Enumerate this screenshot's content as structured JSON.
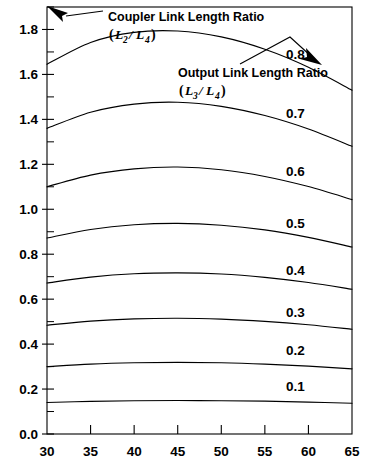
{
  "chart_data": {
    "type": "line",
    "title": "",
    "subtitle": "",
    "xlabel": "",
    "ylabel": "",
    "xlim": [
      30,
      65
    ],
    "ylim": [
      0.0,
      1.9
    ],
    "grid": false,
    "legend_position": "inline-right-of-curve",
    "x_ticks": [
      30,
      35,
      40,
      45,
      50,
      55,
      60,
      65
    ],
    "x_tick_labels": [
      "30",
      "35",
      "40",
      "45",
      "50",
      "55",
      "60",
      "65"
    ],
    "x_minor_ticks": [],
    "y_ticks": [
      0.0,
      0.2,
      0.4,
      0.6,
      0.8,
      1.0,
      1.2,
      1.4,
      1.6,
      1.8
    ],
    "y_tick_labels": [
      "0.0",
      "0.2",
      "0.4",
      "0.6",
      "0.8",
      "1.0",
      "1.2",
      "1.4",
      "1.6",
      "1.8"
    ],
    "y_minor_ticks": [
      0.1,
      0.3,
      0.5,
      0.7,
      0.9,
      1.1,
      1.3,
      1.5,
      1.7,
      1.9
    ],
    "series_parameter_name": "Output Link Length Ratio (L3/L4)",
    "value_axis_name": "Coupler Link Length Ratio (L2/L4)",
    "x": [
      30,
      35,
      40,
      45,
      50,
      55,
      60,
      65
    ],
    "series": [
      {
        "name": "0.8",
        "label": "0.8",
        "label_x": 58.5,
        "label_y": 1.69,
        "values": [
          1.645,
          1.742,
          1.787,
          1.793,
          1.767,
          1.712,
          1.632,
          1.53
        ]
      },
      {
        "name": "0.7",
        "label": "0.7",
        "label_x": 58.5,
        "label_y": 1.43,
        "values": [
          1.36,
          1.432,
          1.468,
          1.476,
          1.458,
          1.417,
          1.357,
          1.28
        ]
      },
      {
        "name": "0.6",
        "label": "0.6",
        "label_x": 58.5,
        "label_y": 1.17,
        "values": [
          1.1,
          1.152,
          1.18,
          1.188,
          1.176,
          1.146,
          1.101,
          1.043
        ]
      },
      {
        "name": "0.5",
        "label": "0.5",
        "label_x": 58.5,
        "label_y": 0.94,
        "values": [
          0.872,
          0.91,
          0.931,
          0.937,
          0.929,
          0.908,
          0.875,
          0.832
        ]
      },
      {
        "name": "0.4",
        "label": "0.4",
        "label_x": 58.5,
        "label_y": 0.73,
        "values": [
          0.672,
          0.698,
          0.713,
          0.717,
          0.712,
          0.697,
          0.674,
          0.644
        ]
      },
      {
        "name": "0.3",
        "label": "0.3",
        "label_x": 58.5,
        "label_y": 0.545,
        "values": [
          0.484,
          0.502,
          0.512,
          0.515,
          0.511,
          0.501,
          0.486,
          0.466
        ]
      },
      {
        "name": "0.2",
        "label": "0.2",
        "label_x": 58.5,
        "label_y": 0.375,
        "values": [
          0.3,
          0.311,
          0.317,
          0.319,
          0.317,
          0.311,
          0.302,
          0.29
        ]
      },
      {
        "name": "0.1",
        "label": "0.1",
        "label_x": 58.5,
        "label_y": 0.215,
        "values": [
          0.14,
          0.145,
          0.148,
          0.149,
          0.148,
          0.146,
          0.142,
          0.137
        ]
      }
    ],
    "annotations": [
      {
        "id": "coupler-annotation",
        "line1": "Coupler Link Length Ratio",
        "math_open": "(",
        "math_num": "L",
        "math_num_sub": "2",
        "math_slash": "/",
        "math_den": "L",
        "math_den_sub": "4",
        "math_close": ")",
        "arrow": "up-left"
      },
      {
        "id": "output-annotation",
        "line1": "Output Link Length Ratio",
        "math_open": "(",
        "math_num": "L",
        "math_num_sub": "3",
        "math_slash": "/",
        "math_den": "L",
        "math_den_sub": "4",
        "math_close": ")",
        "arrow": "down-right"
      }
    ]
  },
  "colors": {
    "background": "#ffffff",
    "ink": "#000000",
    "curve": "#000000"
  }
}
